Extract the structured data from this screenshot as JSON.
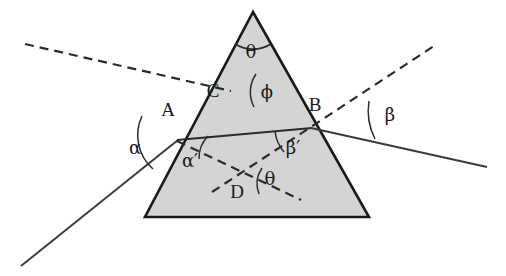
{
  "figure": {
    "type": "optics-ray-diagram",
    "width": 506,
    "height": 276,
    "background_color": "#ffffff"
  },
  "prism": {
    "name": "triangular-prism",
    "fill_color": "#d4d4d4",
    "stroke_color": "#1a1a1a",
    "apex": {
      "x": 253,
      "y": 12
    },
    "bottom_left": {
      "x": 145,
      "y": 217
    },
    "bottom_right": {
      "x": 369,
      "y": 217
    }
  },
  "points": {
    "a": {
      "label": "A",
      "x": 177,
      "y": 140,
      "label_x": 168,
      "label_y": 116
    },
    "b": {
      "label": "B",
      "x": 311,
      "y": 128,
      "label_x": 313,
      "label_y": 111
    },
    "c": {
      "label": "C",
      "x": 228,
      "y": 90,
      "label_x": 211,
      "label_y": 95
    },
    "d": {
      "label": "D",
      "x": 243,
      "y": 182,
      "label_x": 235,
      "label_y": 196
    }
  },
  "angles": {
    "alpha": {
      "label": "α",
      "x": 141,
      "y": 154,
      "description": "angle of incidence at A"
    },
    "alpha_prime": {
      "label": "α′",
      "x": 183,
      "y": 164,
      "description": "refraction angle inside prism at A"
    },
    "beta": {
      "label": "β",
      "x": 387,
      "y": 118,
      "description": "angle of emergence at B"
    },
    "beta_prime": {
      "label": "β′",
      "x": 288,
      "y": 151,
      "description": "internal incidence angle at B"
    },
    "theta_apex": {
      "label": "θ",
      "x": 247,
      "y": 54,
      "description": "prism apex angle"
    },
    "theta_d": {
      "label": "θ",
      "x": 266,
      "y": 181,
      "description": "angle at D between normals"
    },
    "phi": {
      "label": "ϕ",
      "x": 262,
      "y": 95,
      "description": "deviation-related angle at C"
    }
  },
  "rays": {
    "incident_solid": {
      "name": "incident-ray",
      "from": {
        "x": 21,
        "y": 266
      },
      "to": {
        "x": 177,
        "y": 140
      },
      "style": "solid"
    },
    "incident_normal_dashed": {
      "name": "normal-at-a",
      "from": {
        "x": 25,
        "y": 44
      },
      "to": {
        "x": 228,
        "y": 90
      },
      "style": "dashed"
    },
    "internal_solid": {
      "name": "internal-ray-a-to-b",
      "from": {
        "x": 177,
        "y": 140
      },
      "to": {
        "x": 311,
        "y": 128
      },
      "style": "solid"
    },
    "a_to_d_dashed": {
      "name": "dashed-a-to-d",
      "from": {
        "x": 177,
        "y": 140
      },
      "to": {
        "x": 300,
        "y": 199
      },
      "style": "dashed"
    },
    "normal_at_b_dashed": {
      "name": "normal-at-b",
      "from": {
        "x": 213,
        "y": 191
      },
      "to": {
        "x": 434,
        "y": 46
      },
      "style": "dashed"
    },
    "emergent_solid": {
      "name": "emergent-ray",
      "from": {
        "x": 311,
        "y": 128
      },
      "to": {
        "x": 486,
        "y": 166
      },
      "style": "solid"
    }
  },
  "arcs": [
    {
      "name": "arc-alpha",
      "description": "arc at A between incident ray and normal"
    },
    {
      "name": "arc-alpha-prime",
      "description": "arc at A inside prism"
    },
    {
      "name": "arc-beta",
      "description": "arc at B between normal and emergent ray"
    },
    {
      "name": "arc-beta-prime",
      "description": "arc at B inside prism"
    },
    {
      "name": "arc-theta-apex",
      "description": "arc at prism apex"
    },
    {
      "name": "arc-theta-d",
      "description": "arc at D"
    },
    {
      "name": "arc-phi",
      "description": "arc at C"
    }
  ]
}
